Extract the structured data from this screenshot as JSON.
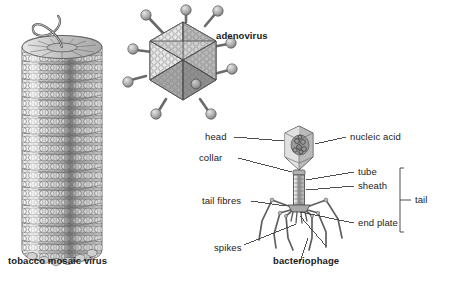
{
  "figure": {
    "background": "#ffffff",
    "ink": "#1a1a1a",
    "line_color": "#4a4a4a"
  },
  "specimens": {
    "tmv": {
      "caption": "tobacco mosaic virus",
      "caption_bold": true,
      "caption_x": 8,
      "caption_y": 262,
      "description": "helical rod of protein subunits with RNA strand emerging at top"
    },
    "adenovirus": {
      "caption": "adenovirus",
      "caption_bold": true,
      "caption_x": 216,
      "caption_y": 37,
      "description": "icosahedral capsid with knobbed fibre projections at vertices"
    },
    "bacteriophage": {
      "caption": "bacteriophage",
      "caption_bold": true,
      "caption_x": 273,
      "caption_y": 262,
      "description": "head, collar, contractile sheath, tube, end plate, tail fibres and spikes"
    }
  },
  "callouts": [
    {
      "key": "head",
      "text": "head",
      "x": 205,
      "y": 137,
      "align": "left"
    },
    {
      "key": "collar",
      "text": "collar",
      "x": 199,
      "y": 158,
      "align": "left"
    },
    {
      "key": "nucleic_acid",
      "text": "nucleic acid",
      "x": 350,
      "y": 137,
      "align": "left"
    },
    {
      "key": "tube",
      "text": "tube",
      "x": 358,
      "y": 172,
      "align": "left"
    },
    {
      "key": "sheath",
      "text": "sheath",
      "x": 358,
      "y": 186,
      "align": "left"
    },
    {
      "key": "end_plate",
      "text": "end plate",
      "x": 358,
      "y": 223,
      "align": "left"
    },
    {
      "key": "tail_fibres",
      "text": "tail fibres",
      "x": 202,
      "y": 201,
      "align": "left"
    },
    {
      "key": "spikes",
      "text": "spikes",
      "x": 214,
      "y": 248,
      "align": "left"
    },
    {
      "key": "tail",
      "text": "tail",
      "x": 415,
      "y": 196,
      "align": "left"
    }
  ],
  "bracket": {
    "label": "tail",
    "x": 400,
    "top": 168,
    "bottom": 232,
    "tick_y": 200
  }
}
